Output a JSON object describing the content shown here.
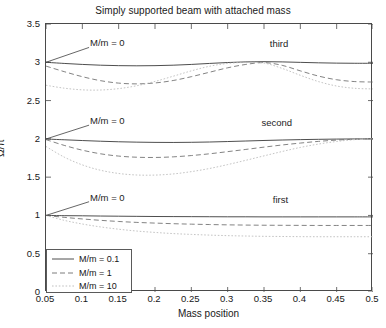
{
  "chart_data": {
    "type": "line",
    "title": "Simply supported beam with attached mass",
    "xlabel": "Mass position",
    "ylabel": "Ω/π",
    "xlim": [
      0.05,
      0.5
    ],
    "ylim": [
      0,
      3.5
    ],
    "xticks": [
      0.05,
      0.1,
      0.15,
      0.2,
      0.25,
      0.3,
      0.35,
      0.4,
      0.45,
      0.5
    ],
    "xtick_labels": [
      "0.05",
      "0.1",
      "0.15",
      "0.2",
      "0.25",
      "0.3",
      "0.35",
      "0.4",
      "0.45",
      "0.5"
    ],
    "yticks": [
      0,
      0.5,
      1,
      1.5,
      2,
      2.5,
      3,
      3.5
    ],
    "ytick_labels": [
      "0",
      "0.5",
      "1",
      "1.5",
      "2",
      "2.5",
      "3",
      "3.5"
    ],
    "grid": false,
    "legend_position": "lower left",
    "x": [
      0.05,
      0.075,
      0.1,
      0.125,
      0.15,
      0.175,
      0.2,
      0.225,
      0.25,
      0.275,
      0.3,
      0.325,
      0.35,
      0.375,
      0.4,
      0.425,
      0.45,
      0.475,
      0.5
    ],
    "series": [
      {
        "name": "M/m = 0.1",
        "mode": "third",
        "style": "solid",
        "color": "#3a3a3a",
        "values": [
          3.0,
          2.985,
          2.972,
          2.962,
          2.956,
          2.954,
          2.956,
          2.962,
          2.972,
          2.985,
          2.997,
          3.005,
          3.008,
          3.005,
          2.999,
          2.993,
          2.989,
          2.987,
          2.987
        ]
      },
      {
        "name": "M/m = 1",
        "mode": "third",
        "style": "dashed",
        "color": "#6d6d6d",
        "values": [
          2.95,
          2.878,
          2.812,
          2.76,
          2.728,
          2.718,
          2.73,
          2.762,
          2.812,
          2.87,
          2.928,
          2.972,
          2.996,
          2.96,
          2.888,
          2.82,
          2.772,
          2.748,
          2.742
        ]
      },
      {
        "name": "M/m = 10",
        "mode": "third",
        "style": "dotted",
        "color": "#b9b9b9",
        "values": [
          2.7,
          2.662,
          2.64,
          2.638,
          2.656,
          2.694,
          2.75,
          2.818,
          2.888,
          2.948,
          2.985,
          2.998,
          2.99,
          2.92,
          2.83,
          2.748,
          2.69,
          2.66,
          2.652
        ]
      },
      {
        "name": "M/m = 0.1",
        "mode": "second",
        "style": "solid",
        "color": "#3a3a3a",
        "values": [
          1.998,
          1.988,
          1.978,
          1.969,
          1.962,
          1.957,
          1.954,
          1.953,
          1.955,
          1.959,
          1.965,
          1.972,
          1.979,
          1.985,
          1.99,
          1.994,
          1.997,
          1.999,
          2.0
        ]
      },
      {
        "name": "M/m = 1",
        "mode": "second",
        "style": "dashed",
        "color": "#6d6d6d",
        "values": [
          1.99,
          1.915,
          1.852,
          1.805,
          1.775,
          1.76,
          1.757,
          1.765,
          1.782,
          1.805,
          1.833,
          1.862,
          1.892,
          1.92,
          1.945,
          1.967,
          1.984,
          1.995,
          2.0
        ]
      },
      {
        "name": "M/m = 10",
        "mode": "second",
        "style": "dotted",
        "color": "#b9b9b9",
        "values": [
          1.9,
          1.762,
          1.66,
          1.59,
          1.548,
          1.528,
          1.527,
          1.542,
          1.572,
          1.613,
          1.664,
          1.72,
          1.778,
          1.835,
          1.888,
          1.932,
          1.966,
          1.99,
          2.0
        ]
      },
      {
        "name": "M/m = 0.1",
        "mode": "first",
        "style": "solid",
        "color": "#3a3a3a",
        "values": [
          1.0,
          0.997,
          0.995,
          0.992,
          0.99,
          0.988,
          0.986,
          0.985,
          0.984,
          0.983,
          0.982,
          0.982,
          0.981,
          0.981,
          0.981,
          0.981,
          0.981,
          0.981,
          0.981
        ]
      },
      {
        "name": "M/m = 1",
        "mode": "first",
        "style": "dashed",
        "color": "#6d6d6d",
        "values": [
          1.0,
          0.975,
          0.954,
          0.936,
          0.921,
          0.909,
          0.9,
          0.892,
          0.886,
          0.881,
          0.877,
          0.874,
          0.872,
          0.871,
          0.87,
          0.869,
          0.869,
          0.869,
          0.869
        ]
      },
      {
        "name": "M/m = 10",
        "mode": "first",
        "style": "dotted",
        "color": "#b9b9b9",
        "values": [
          1.0,
          0.936,
          0.888,
          0.85,
          0.82,
          0.796,
          0.778,
          0.763,
          0.752,
          0.743,
          0.736,
          0.731,
          0.727,
          0.725,
          0.723,
          0.722,
          0.722,
          0.722,
          0.722
        ]
      }
    ],
    "annotations": [
      {
        "text": "M/m = 0",
        "x": 0.112,
        "y": 3.22,
        "leader_to_x": 0.05,
        "leader_to_y": 3.0
      },
      {
        "text": "M/m = 0",
        "x": 0.112,
        "y": 2.205,
        "leader_to_x": 0.05,
        "leader_to_y": 1.998
      },
      {
        "text": "M/m = 0",
        "x": 0.112,
        "y": 1.205,
        "leader_to_x": 0.05,
        "leader_to_y": 1.0
      },
      {
        "text": "third",
        "x": 0.372,
        "y": 3.21
      },
      {
        "text": "second",
        "x": 0.369,
        "y": 2.175
      },
      {
        "text": "first",
        "x": 0.374,
        "y": 1.17
      }
    ],
    "legend": [
      {
        "label": "M/m = 0.1",
        "style": "solid",
        "color": "#3a3a3a"
      },
      {
        "label": "M/m = 1",
        "style": "dashed",
        "color": "#6d6d6d"
      },
      {
        "label": "M/m = 10",
        "style": "dotted",
        "color": "#b9b9b9"
      }
    ]
  }
}
